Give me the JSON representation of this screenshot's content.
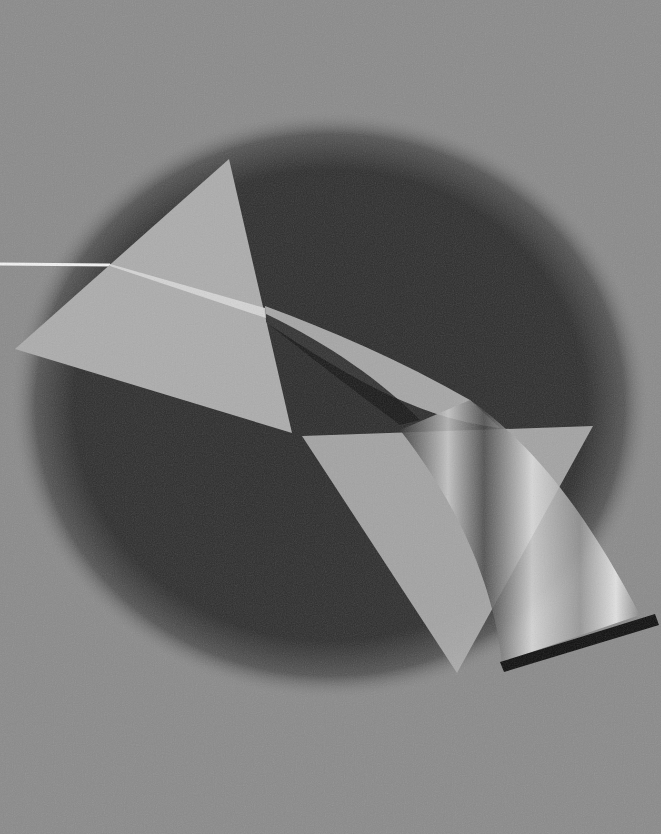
{
  "artwork": {
    "subject": "light beam dispersed through two prisms",
    "colors": {
      "background": "#8a8a8a",
      "shadow": "#2b2b2b",
      "prism": "#acacac",
      "beam": "#f2f2f2",
      "bar": "#0e0e0e"
    }
  }
}
